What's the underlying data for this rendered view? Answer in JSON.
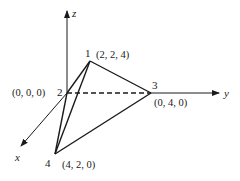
{
  "diagram": {
    "type": "3d-tetrahedron",
    "axes": {
      "x": {
        "label": "x"
      },
      "y": {
        "label": "y"
      },
      "z": {
        "label": "z"
      }
    },
    "vertices": [
      {
        "id": "1",
        "label": "1",
        "coords": "(2, 2, 4)"
      },
      {
        "id": "2",
        "label": "2",
        "coords": "(0, 0, 0)"
      },
      {
        "id": "3",
        "label": "3",
        "coords": "(0, 4, 0)"
      },
      {
        "id": "4",
        "label": "4",
        "coords": "(4, 2, 0)"
      }
    ],
    "edges": [
      {
        "from": "2",
        "to": "1",
        "style": "solid"
      },
      {
        "from": "1",
        "to": "3",
        "style": "solid"
      },
      {
        "from": "1",
        "to": "4",
        "style": "solid"
      },
      {
        "from": "2",
        "to": "4",
        "style": "solid"
      },
      {
        "from": "3",
        "to": "4",
        "style": "solid"
      },
      {
        "from": "2",
        "to": "3",
        "style": "dashed"
      }
    ],
    "colors": {
      "line": "#1a1a1a",
      "background": "#ffffff"
    }
  }
}
